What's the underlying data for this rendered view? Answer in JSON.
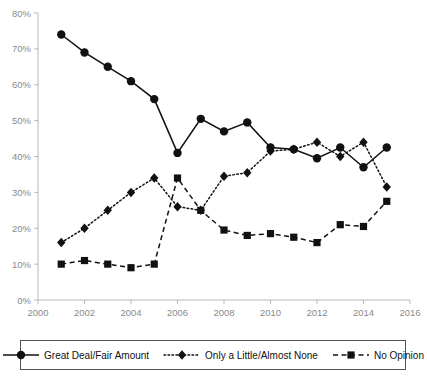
{
  "chart_data": {
    "type": "line",
    "title": "",
    "xlabel": "",
    "ylabel": "",
    "xlim": [
      2000,
      2016
    ],
    "ylim": [
      0,
      80
    ],
    "grid": false,
    "legend_position": "bottom",
    "x_ticks": [
      "2000",
      "2002",
      "2004",
      "2006",
      "2008",
      "2010",
      "2012",
      "2014",
      "2016"
    ],
    "y_ticks": [
      "0%",
      "10%",
      "20%",
      "30%",
      "40%",
      "50%",
      "60%",
      "70%",
      "80%"
    ],
    "x": [
      2001,
      2002,
      2003,
      2004,
      2005,
      2006,
      2007,
      2008,
      2009,
      2010,
      2011,
      2012,
      2013,
      2014,
      2015
    ],
    "series": [
      {
        "name": "Great Deal/Fair Amount",
        "marker": "circle",
        "line_style": "solid",
        "values": [
          74,
          69,
          65,
          61,
          56,
          41,
          50.5,
          47,
          49.5,
          42.5,
          42,
          39.5,
          42.5,
          37,
          42.5
        ]
      },
      {
        "name": "Only a Little/Almost None",
        "marker": "diamond",
        "line_style": "dotted",
        "values": [
          16,
          20,
          25,
          30,
          34,
          26,
          25,
          34.5,
          35.5,
          41.5,
          42,
          44,
          40,
          44,
          31.5
        ]
      },
      {
        "name": "No Opinion",
        "marker": "square",
        "line_style": "dashed",
        "values": [
          10,
          11,
          10,
          9,
          10,
          34,
          25,
          19.5,
          18,
          18.5,
          17.5,
          16,
          21,
          20.5,
          27.5
        ]
      }
    ]
  },
  "legend": {
    "items": [
      {
        "label": "Great Deal/Fair Amount",
        "marker": "circle",
        "line_style": "solid"
      },
      {
        "label": "Only a Little/Almost None",
        "marker": "diamond",
        "line_style": "dotted"
      },
      {
        "label": "No Opinion",
        "marker": "square",
        "line_style": "dashed"
      }
    ]
  }
}
